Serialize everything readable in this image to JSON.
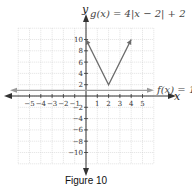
{
  "chart_data": {
    "type": "line",
    "title": "",
    "caption": "Figure 10",
    "xlabel": "x",
    "ylabel": "y",
    "xlim": [
      -6,
      6
    ],
    "ylim": [
      -12,
      12
    ],
    "grid": true,
    "x_ticks": [
      -5,
      -4,
      -3,
      -2,
      -1,
      1,
      2,
      3,
      4,
      5
    ],
    "y_ticks": [
      -10,
      -8,
      -6,
      -4,
      -2,
      2,
      4,
      6,
      8,
      10
    ],
    "series": [
      {
        "name": "g(x) = 4|x − 2| + 2",
        "label": "g(x) = 4|x − 2| + 2",
        "color": "#6b6b6b",
        "points": [
          [
            0,
            10
          ],
          [
            2,
            2
          ],
          [
            4,
            10
          ]
        ]
      },
      {
        "name": "f(x) = 1",
        "label": "f(x) = 1",
        "color": "#9a9a9a",
        "points": [
          [
            -6,
            1
          ],
          [
            6,
            1
          ]
        ]
      }
    ]
  },
  "labels": {
    "g": "g(x) = 4|x − 2| + 2",
    "f": "f(x) = 1",
    "x_axis": "x",
    "y_axis": "y",
    "caption": "Figure 10"
  },
  "colors": {
    "grid": "#cfcfcf",
    "axis": "#333333",
    "g_line": "#6b6b6b",
    "f_line": "#9a9a9a"
  }
}
